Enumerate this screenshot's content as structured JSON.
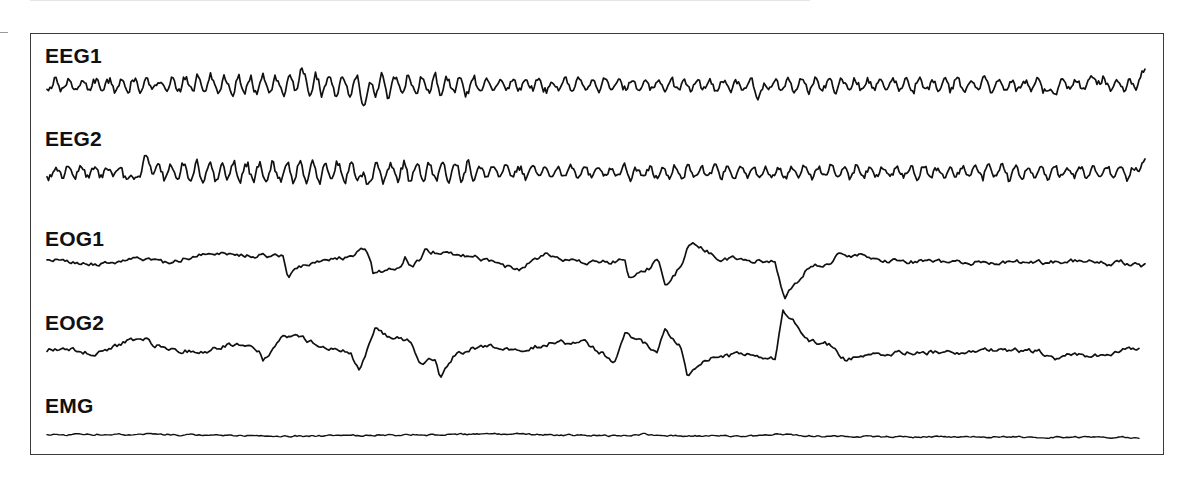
{
  "chart_data": {
    "type": "line",
    "title": "",
    "xlabel": "",
    "ylabel": "",
    "grid": false,
    "legend": "none",
    "x_range_px": [
      47,
      1145
    ],
    "series": [
      {
        "name": "EEG1",
        "label_top": 45,
        "baseline_y": 85,
        "amplitude": 9,
        "style": "eeg",
        "events": [
          {
            "x": 365,
            "dy": 14
          },
          {
            "x": 300,
            "dy": -12
          },
          {
            "x": 760,
            "dy": 12
          },
          {
            "x": 1050,
            "dy": 10
          },
          {
            "x": 1095,
            "dy": -10
          },
          {
            "x": 1143,
            "dy": -11
          }
        ]
      },
      {
        "name": "EEG2",
        "label_top": 128,
        "baseline_y": 172,
        "amplitude": 9,
        "style": "eeg",
        "events": [
          {
            "x": 147,
            "dy": -14
          },
          {
            "x": 132,
            "dy": 10
          },
          {
            "x": 365,
            "dy": 12
          },
          {
            "x": 1143,
            "dy": -10
          }
        ]
      },
      {
        "name": "EOG1",
        "label_top": 228,
        "baseline_y": 262,
        "amplitude": 2.5,
        "style": "eog",
        "keypoints": [
          [
            47,
            260
          ],
          [
            80,
            262
          ],
          [
            100,
            265
          ],
          [
            140,
            258
          ],
          [
            165,
            262
          ],
          [
            200,
            255
          ],
          [
            230,
            254
          ],
          [
            283,
            256
          ],
          [
            288,
            276
          ],
          [
            300,
            268
          ],
          [
            330,
            260
          ],
          [
            355,
            255
          ],
          [
            365,
            248
          ],
          [
            370,
            258
          ],
          [
            373,
            275
          ],
          [
            400,
            265
          ],
          [
            405,
            257
          ],
          [
            410,
            270
          ],
          [
            420,
            260
          ],
          [
            425,
            251
          ],
          [
            440,
            253
          ],
          [
            460,
            256
          ],
          [
            480,
            258
          ],
          [
            500,
            265
          ],
          [
            520,
            270
          ],
          [
            530,
            262
          ],
          [
            545,
            253
          ],
          [
            560,
            258
          ],
          [
            580,
            262
          ],
          [
            610,
            262
          ],
          [
            625,
            259
          ],
          [
            628,
            276
          ],
          [
            650,
            268
          ],
          [
            657,
            258
          ],
          [
            660,
            262
          ],
          [
            665,
            285
          ],
          [
            675,
            275
          ],
          [
            683,
            260
          ],
          [
            690,
            242
          ],
          [
            700,
            248
          ],
          [
            720,
            258
          ],
          [
            750,
            260
          ],
          [
            775,
            260
          ],
          [
            780,
            280
          ],
          [
            785,
            298
          ],
          [
            800,
            278
          ],
          [
            810,
            266
          ],
          [
            830,
            262
          ],
          [
            840,
            253
          ],
          [
            860,
            256
          ],
          [
            900,
            262
          ],
          [
            960,
            262
          ],
          [
            1000,
            263
          ],
          [
            1060,
            262
          ],
          [
            1090,
            260
          ],
          [
            1110,
            265
          ],
          [
            1120,
            262
          ],
          [
            1145,
            266
          ]
        ]
      },
      {
        "name": "EOG2",
        "label_top": 312,
        "baseline_y": 350,
        "amplitude": 2.5,
        "style": "eog",
        "keypoints": [
          [
            47,
            350
          ],
          [
            70,
            348
          ],
          [
            90,
            353
          ],
          [
            110,
            350
          ],
          [
            130,
            340
          ],
          [
            145,
            338
          ],
          [
            155,
            345
          ],
          [
            180,
            350
          ],
          [
            200,
            352
          ],
          [
            220,
            348
          ],
          [
            230,
            344
          ],
          [
            260,
            350
          ],
          [
            263,
            360
          ],
          [
            272,
            352
          ],
          [
            285,
            335
          ],
          [
            300,
            338
          ],
          [
            320,
            345
          ],
          [
            340,
            350
          ],
          [
            350,
            352
          ],
          [
            360,
            372
          ],
          [
            370,
            340
          ],
          [
            376,
            327
          ],
          [
            390,
            338
          ],
          [
            400,
            338
          ],
          [
            410,
            340
          ],
          [
            420,
            362
          ],
          [
            435,
            360
          ],
          [
            440,
            378
          ],
          [
            455,
            355
          ],
          [
            470,
            349
          ],
          [
            490,
            346
          ],
          [
            520,
            350
          ],
          [
            550,
            343
          ],
          [
            560,
            342
          ],
          [
            570,
            345
          ],
          [
            585,
            343
          ],
          [
            600,
            352
          ],
          [
            615,
            362
          ],
          [
            625,
            335
          ],
          [
            640,
            340
          ],
          [
            657,
            352
          ],
          [
            665,
            330
          ],
          [
            680,
            345
          ],
          [
            688,
            378
          ],
          [
            700,
            362
          ],
          [
            720,
            355
          ],
          [
            760,
            356
          ],
          [
            775,
            360
          ],
          [
            783,
            312
          ],
          [
            790,
            318
          ],
          [
            810,
            340
          ],
          [
            830,
            345
          ],
          [
            845,
            360
          ],
          [
            870,
            355
          ],
          [
            900,
            352
          ],
          [
            950,
            352
          ],
          [
            1000,
            350
          ],
          [
            1040,
            352
          ],
          [
            1055,
            360
          ],
          [
            1070,
            355
          ],
          [
            1110,
            355
          ],
          [
            1125,
            347
          ],
          [
            1140,
            350
          ]
        ]
      },
      {
        "name": "EMG",
        "label_top": 395,
        "baseline_y": 436,
        "amplitude": 0.9,
        "style": "emg",
        "keypoints": [
          [
            47,
            435
          ],
          [
            145,
            434
          ],
          [
            200,
            435
          ],
          [
            300,
            436
          ],
          [
            400,
            435
          ],
          [
            500,
            434
          ],
          [
            620,
            436
          ],
          [
            645,
            434
          ],
          [
            660,
            436
          ],
          [
            690,
            436
          ],
          [
            750,
            436
          ],
          [
            780,
            434
          ],
          [
            800,
            436
          ],
          [
            900,
            437
          ],
          [
            1000,
            437
          ],
          [
            1100,
            437
          ],
          [
            1140,
            438
          ]
        ]
      }
    ]
  },
  "labels": {
    "eeg1": "EEG1",
    "eeg2": "EEG2",
    "eog1": "EOG1",
    "eog2": "EOG2",
    "emg": "EMG"
  },
  "colors": {
    "trace": "#111111",
    "frame": "#3a3a3a",
    "background": "#ffffff"
  }
}
